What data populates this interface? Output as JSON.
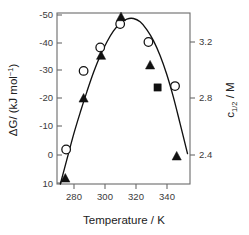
{
  "chart_data": {
    "type": "scatter",
    "title": "",
    "xlabel": "Temperature / K",
    "ylabel": "ΔG/ (kJ mol⁻¹)",
    "y2label": "c1/2 / M",
    "xlim": [
      272,
      352
    ],
    "ylim": [
      10,
      -52
    ],
    "y2lim": [
      2.3,
      3.37
    ],
    "grid": false,
    "legend": "none",
    "xticks": [
      280,
      300,
      320,
      340
    ],
    "xtick_labels": [
      "280",
      "300",
      "320",
      "340"
    ],
    "yticks": [
      -50,
      -40,
      -30,
      -20,
      -10,
      0,
      10
    ],
    "ytick_labels": [
      "-50",
      "-40",
      "-30",
      "-20",
      "-10",
      "0",
      "10"
    ],
    "y2ticks": [
      3.2,
      2.8,
      2.4
    ],
    "y2tick_labels": [
      "3.2",
      "2.8",
      "2.4"
    ],
    "series": [
      {
        "name": "open-circles",
        "marker": "open-circle",
        "axis": "left",
        "points": [
          {
            "x": 277.5,
            "y": -2.5
          },
          {
            "x": 288.0,
            "y": -31.0
          },
          {
            "x": 298.0,
            "y": -39.5
          },
          {
            "x": 310.0,
            "y": -48.0
          },
          {
            "x": 327.0,
            "y": -41.5
          },
          {
            "x": 343.0,
            "y": -25.5
          }
        ]
      },
      {
        "name": "filled-triangles",
        "marker": "filled-triangle",
        "axis": "left",
        "points": [
          {
            "x": 277.0,
            "y": 8.0
          },
          {
            "x": 288.0,
            "y": -21.0
          },
          {
            "x": 298.5,
            "y": -36.5
          },
          {
            "x": 310.5,
            "y": -50.5
          },
          {
            "x": 328.0,
            "y": -33.0
          },
          {
            "x": 344.0,
            "y": 0.0
          }
        ]
      },
      {
        "name": "filled-square",
        "marker": "filled-square",
        "axis": "left",
        "points": [
          {
            "x": 332.5,
            "y": -25.0
          }
        ]
      }
    ],
    "fit_curve": {
      "name": "fitted-curve",
      "x": [
        274.0,
        278.0,
        282.0,
        286.0,
        290.0,
        294.0,
        298.0,
        302.0,
        306.0,
        310.0,
        314.0,
        318.0,
        322.0,
        326.0,
        330.0,
        334.0,
        338.0,
        342.0,
        346.0,
        350.5
      ],
      "y": [
        10.0,
        1.0,
        -8.0,
        -16.0,
        -23.5,
        -30.5,
        -36.5,
        -41.5,
        -45.5,
        -48.3,
        -49.8,
        -50.0,
        -48.8,
        -46.0,
        -42.0,
        -36.6,
        -29.8,
        -21.5,
        -12.0,
        -1.0
      ]
    }
  },
  "axes": {
    "left_label_main": "ΔG/ (kJ mol",
    "left_label_sup": "−1",
    "left_label_tail": ")",
    "right_label_c": "c",
    "right_label_sub": "1/2",
    "right_label_tail": " / M",
    "bottom_label": "Temperature / K"
  }
}
